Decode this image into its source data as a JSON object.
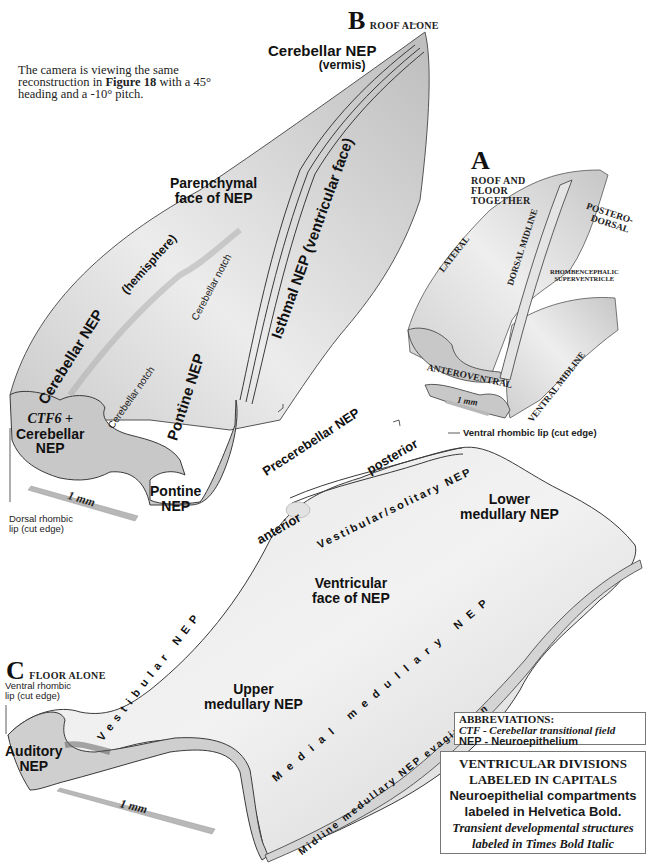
{
  "caption": {
    "pre": "The camera is viewing the same reconstruction in ",
    "bold": "Figure 18",
    "post": " with a 45° heading and a -10° pitch."
  },
  "panels": {
    "A": {
      "letter": "A",
      "title_lines": [
        "ROOF AND",
        "FLOOR",
        "TOGETHER"
      ],
      "labels": {
        "lateral": "LATERAL",
        "dorsal_midline": "DORSAL MIDLINE",
        "posterodorsal_1": "POSTERO-",
        "posterodorsal_2": "DORSAL",
        "superventricle_1": "RHOMBENCEPHALIC",
        "superventricle_2": "SUPERVENTRICLE",
        "anteroventral": "ANTEROVENTRAL",
        "ventral_midline": "VENTRAL MIDLINE",
        "scale": "1 mm"
      }
    },
    "B": {
      "letter": "B",
      "title": "ROOF ALONE",
      "labels": {
        "cerebellar_vermis_1": "Cerebellar NEP",
        "cerebellar_vermis_2": "(vermis)",
        "parenchymal_1": "Parenchymal",
        "parenchymal_2": "face of NEP",
        "isthmal": "Isthmal NEP (ventricular face)",
        "cerebellar_hemisphere": "Cerebellar NEP",
        "hemisphere": "(hemisphere)",
        "notch_upper": "Cerebellar notch",
        "notch_lower": "Cerebellar notch",
        "pontine_face": "Pontine NEP",
        "ctf_1": "CTF6 +",
        "ctf_2": "Cerebellar",
        "ctf_3": "NEP",
        "pontine_cut_1": "Pontine",
        "pontine_cut_2": "NEP",
        "dorsal_lip_1": "Dorsal rhombic",
        "dorsal_lip_2": "lip (cut edge)",
        "scale": "1 mm"
      }
    },
    "C": {
      "letter": "C",
      "title": "FLOOR ALONE",
      "labels": {
        "precerebellar": "Precerebellar NEP",
        "anterior": "anterior",
        "posterior": "posterior",
        "ventral_lip_top": "Ventral rhombic lip (cut edge)",
        "vestibular_solitary": "Vestibular/solitary NEP",
        "lower_1": "Lower",
        "lower_2": "medullary NEP",
        "ventricular_1": "Ventricular",
        "ventricular_2": "face of NEP",
        "vestibular": "Vestibular NEP",
        "upper_1": "Upper",
        "upper_2": "medullary NEP",
        "medial": "Medial medullary NEP",
        "midline": "Midline medullary NEP evagination",
        "auditory_1": "Auditory",
        "auditory_2": "NEP",
        "ventral_lip_1": "Ventral rhombic",
        "ventral_lip_2": "lip (cut edge)",
        "scale": "1 mm"
      }
    }
  },
  "abbreviations": {
    "title": "ABBREVIATIONS:",
    "ctf": "CTF - Cerebellar transitional field",
    "nep": "NEP - Neuroepithelium"
  },
  "legend": {
    "line1": "VENTRICULAR DIVISIONS",
    "line2": "LABELED IN CAPITALS",
    "line3": "Neuroepithelial compartments",
    "line4": "labeled in Helvetica Bold.",
    "line5": "Transient developmental structures",
    "line6": "labeled in Times Bold Italic"
  },
  "colors": {
    "surface": "#d9d9d9",
    "cut_face": "#c8c8c8",
    "outline": "#3a3a3a",
    "scale_bar": "#b8b8b8"
  }
}
